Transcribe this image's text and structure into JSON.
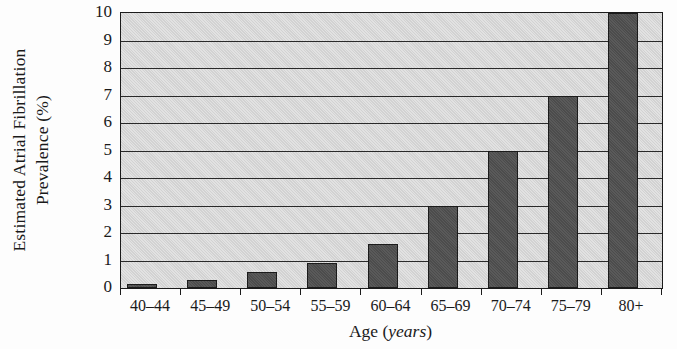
{
  "chart_data": {
    "type": "bar",
    "title": "",
    "xlabel": "Age (years)",
    "xlabel_plain": "Age",
    "xlabel_italic": "years",
    "ylabel": "Estimated Atrial Fibrillation Prevalence (%)",
    "ylabel_line1": "Estimated Atrial Fibrillation",
    "ylabel_line2": "Prevalence (%)",
    "categories": [
      "40–44",
      "45–49",
      "50–54",
      "55–59",
      "60–64",
      "65–69",
      "70–74",
      "75–79",
      "80+"
    ],
    "values": [
      0.15,
      0.3,
      0.6,
      0.9,
      1.6,
      3.0,
      5.0,
      7.0,
      10.0
    ],
    "yticks": [
      0,
      1,
      2,
      3,
      4,
      5,
      6,
      7,
      8,
      9,
      10
    ],
    "ytick_labels": [
      "0",
      "1",
      "2",
      "3",
      "4",
      "5",
      "6",
      "7",
      "8",
      "9",
      "10"
    ],
    "ylim": [
      0,
      10
    ],
    "grid": true,
    "legend": "none",
    "colors": {
      "bar_fill": "#4c4c4c",
      "bar_edge": "#1b1b1b",
      "plot_background": "#d2d2d2",
      "gridline": "#2a2a2a",
      "axis": "#1b1b1b",
      "text": "#1a1a1a",
      "figure_background": "#fdfdfd"
    }
  }
}
